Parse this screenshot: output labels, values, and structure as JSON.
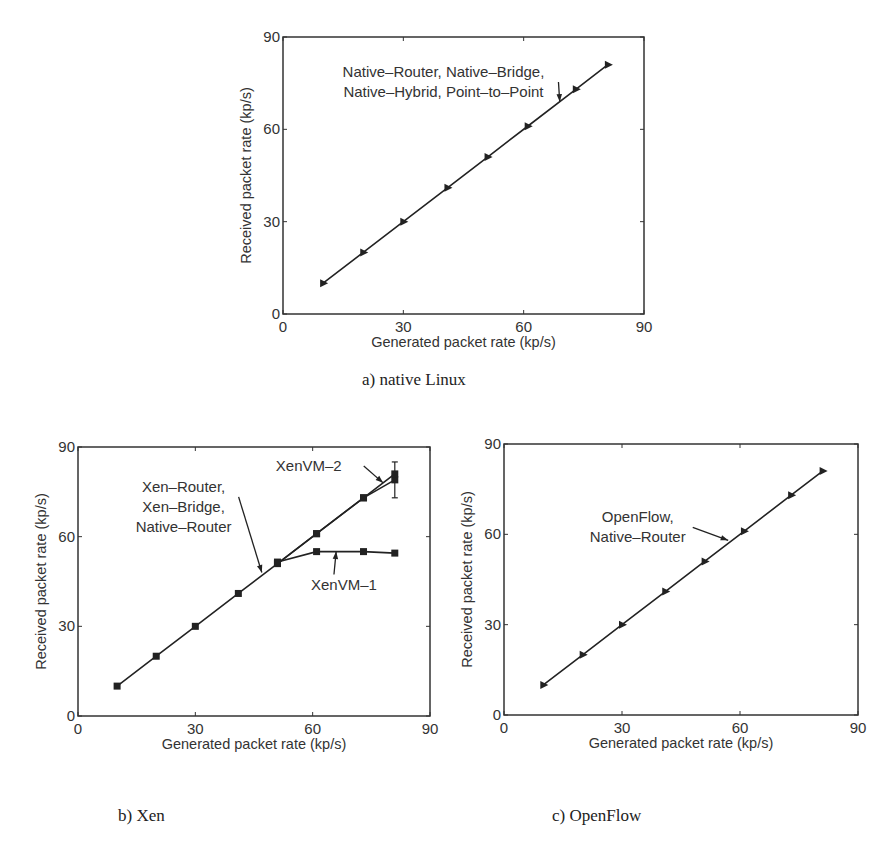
{
  "chart_data": [
    {
      "id": "a",
      "type": "line",
      "caption": "a) native Linux",
      "xlabel": "Generated packet rate (kp/s)",
      "ylabel": "Received packet rate (kp/s)",
      "xlim": [
        0,
        90
      ],
      "ylim": [
        0,
        90
      ],
      "xticks": [
        0,
        30,
        60,
        90
      ],
      "yticks": [
        0,
        30,
        60,
        90
      ],
      "grid": false,
      "series": [
        {
          "name": "Native-Router, Native-Bridge, Native-Hybrid, Point-to-Point",
          "marker": "triangle",
          "x": [
            10,
            20,
            30,
            41,
            51,
            61,
            73,
            81
          ],
          "y": [
            10,
            20,
            30,
            41,
            51,
            61,
            73,
            81
          ]
        }
      ],
      "annotations": [
        {
          "lines": [
            "Native–Router, Native–Bridge,",
            "Native–Hybrid, Point–to–Point"
          ],
          "text_x": 40,
          "text_y": 77,
          "arrow_to": [
            69,
            69
          ]
        }
      ]
    },
    {
      "id": "b",
      "type": "line",
      "caption": "b) Xen",
      "xlabel": "Generated packet rate (kp/s)",
      "ylabel": "Received packet rate (kp/s)",
      "xlim": [
        0,
        90
      ],
      "ylim": [
        0,
        90
      ],
      "xticks": [
        0,
        30,
        60,
        90
      ],
      "yticks": [
        0,
        30,
        60,
        90
      ],
      "grid": false,
      "series": [
        {
          "name": "Xen-Router, Xen-Bridge, Native-Router",
          "marker": "square",
          "x": [
            10,
            20,
            30,
            41,
            51,
            61,
            73,
            81
          ],
          "y": [
            10,
            20,
            30,
            41,
            51,
            61,
            73,
            79
          ]
        },
        {
          "name": "XenVM-2",
          "marker": "square",
          "x": [
            51,
            61,
            73,
            81
          ],
          "y": [
            51,
            61,
            73,
            81
          ],
          "error_bar": {
            "x": 81,
            "low": 73,
            "high": 85
          }
        },
        {
          "name": "XenVM-1",
          "marker": "square",
          "x": [
            51,
            61,
            73,
            81
          ],
          "y": [
            51.5,
            55,
            55,
            54.5
          ]
        }
      ],
      "annotations": [
        {
          "lines": [
            "Xen–Router,",
            "Xen–Bridge,",
            "Native–Router"
          ],
          "text_x": 27,
          "text_y": 75,
          "arrow_to": [
            47,
            48
          ]
        },
        {
          "lines": [
            "XenVM–2"
          ],
          "text_x": 59,
          "text_y": 82,
          "arrow_to": [
            78,
            78
          ]
        },
        {
          "lines": [
            "XenVM–1"
          ],
          "text_x": 68,
          "text_y": 42,
          "arrow_to": [
            66,
            55
          ]
        }
      ]
    },
    {
      "id": "c",
      "type": "line",
      "caption": "c) OpenFlow",
      "xlabel": "Generated packet rate (kp/s)",
      "ylabel": "Received packet rate (kp/s)",
      "xlim": [
        0,
        90
      ],
      "ylim": [
        0,
        90
      ],
      "xticks": [
        0,
        30,
        60,
        90
      ],
      "yticks": [
        0,
        30,
        60,
        90
      ],
      "grid": false,
      "series": [
        {
          "name": "OpenFlow, Native-Router",
          "marker": "triangle",
          "x": [
            10,
            20,
            30,
            41,
            51,
            61,
            73,
            81
          ],
          "y": [
            10,
            20,
            30,
            41,
            51,
            61,
            73,
            81
          ]
        }
      ],
      "annotations": [
        {
          "lines": [
            "OpenFlow,",
            "Native–Router"
          ],
          "text_x": 34,
          "text_y": 64,
          "arrow_to": [
            57,
            58
          ]
        }
      ]
    }
  ],
  "layout": [
    {
      "left": 283,
      "right": 644,
      "top": 37,
      "bottom": 314,
      "caption_x": 362,
      "caption_y": 370
    },
    {
      "left": 78,
      "right": 430,
      "top": 447,
      "bottom": 716,
      "caption_x": 118,
      "caption_y": 806
    },
    {
      "left": 504,
      "right": 858,
      "top": 444,
      "bottom": 715,
      "caption_x": 552,
      "caption_y": 806
    }
  ],
  "colors": {
    "line": "#222222",
    "axis": "#333333",
    "text": "#333333"
  }
}
